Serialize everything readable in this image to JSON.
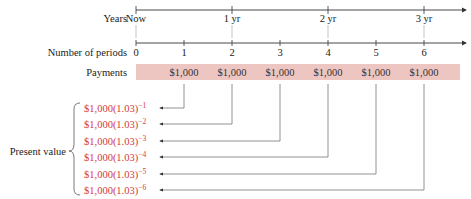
{
  "diagram": {
    "rows": {
      "years_label": "Years",
      "periods_label": "Number of periods",
      "payments_label": "Payments",
      "present_value_label": "Present value"
    },
    "years_ticks": [
      "Now",
      "1 yr",
      "2 yr",
      "3 yr"
    ],
    "period_ticks": [
      "0",
      "1",
      "2",
      "3",
      "4",
      "5",
      "6"
    ],
    "payments": [
      "$1,000",
      "$1,000",
      "$1,000",
      "$1,000",
      "$1,000",
      "$1,000"
    ],
    "present_values": [
      {
        "base": "$1,000(1.03)",
        "exp": "−1"
      },
      {
        "base": "$1,000(1.03)",
        "exp": "−2"
      },
      {
        "base": "$1,000(1.03)",
        "exp": "−3"
      },
      {
        "base": "$1,000(1.03)",
        "exp": "−4"
      },
      {
        "base": "$1,000(1.03)",
        "exp": "−5"
      },
      {
        "base": "$1,000(1.03)",
        "exp": "−6"
      }
    ],
    "colors": {
      "payments_band": "#eec6c1",
      "present_value_text": "#d33a3a",
      "lines": "#666666"
    }
  }
}
